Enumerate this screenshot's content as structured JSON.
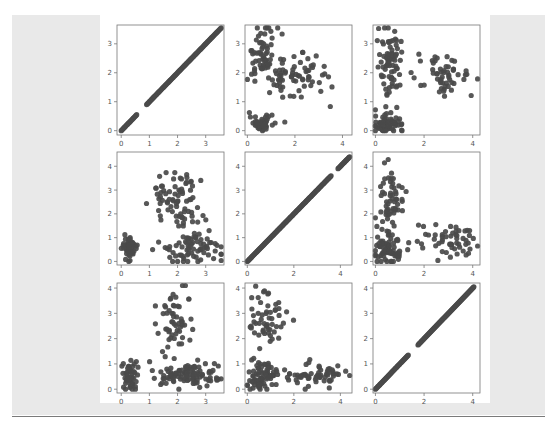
{
  "chart_data": {
    "type": "scatter",
    "title": "",
    "layout": "3x3 scatter matrix (pairplot)",
    "point_color": "#4a4a4a",
    "grid": false,
    "legend": null,
    "panels": [
      {
        "row": 0,
        "col": 0,
        "kind": "diagonal",
        "xlim": [
          -0.15,
          3.65
        ],
        "ylim": [
          -0.15,
          3.65
        ],
        "xticks": [
          0,
          1,
          2,
          3
        ],
        "yticks": [
          0,
          1,
          2,
          3
        ],
        "segments": [
          [
            0.0,
            0.55
          ],
          [
            0.9,
            3.55
          ]
        ]
      },
      {
        "row": 0,
        "col": 1,
        "kind": "clusters",
        "xlim": [
          -0.1,
          4.4
        ],
        "ylim": [
          -0.15,
          3.65
        ],
        "xticks": [
          0,
          2,
          4
        ],
        "yticks": [
          0,
          1,
          2,
          3
        ],
        "clusters": [
          {
            "cx": 0.6,
            "cy": 0.25,
            "sx": 0.25,
            "sy": 0.13,
            "n": 55
          },
          {
            "cx": 0.6,
            "cy": 2.6,
            "sx": 0.35,
            "sy": 0.55,
            "n": 60
          },
          {
            "cx": 2.1,
            "cy": 1.9,
            "sx": 0.8,
            "sy": 0.45,
            "n": 70
          }
        ]
      },
      {
        "row": 0,
        "col": 2,
        "kind": "clusters",
        "xlim": [
          -0.1,
          4.3
        ],
        "ylim": [
          -0.15,
          3.65
        ],
        "xticks": [
          0,
          2,
          4
        ],
        "yticks": [
          0,
          1,
          2,
          3
        ],
        "clusters": [
          {
            "cx": 0.55,
            "cy": 0.25,
            "sx": 0.3,
            "sy": 0.12,
            "n": 60
          },
          {
            "cx": 0.6,
            "cy": 2.3,
            "sx": 0.25,
            "sy": 0.65,
            "n": 80
          },
          {
            "cx": 2.9,
            "cy": 1.85,
            "sx": 0.6,
            "sy": 0.35,
            "n": 55
          }
        ]
      },
      {
        "row": 1,
        "col": 0,
        "kind": "clusters",
        "xlim": [
          -0.15,
          3.65
        ],
        "ylim": [
          -0.15,
          4.6
        ],
        "xticks": [
          0,
          1,
          2,
          3
        ],
        "yticks": [
          0,
          1,
          2,
          3,
          4
        ],
        "clusters": [
          {
            "cx": 0.3,
            "cy": 0.55,
            "sx": 0.13,
            "sy": 0.25,
            "n": 55
          },
          {
            "cx": 2.0,
            "cy": 2.4,
            "sx": 0.45,
            "sy": 0.85,
            "n": 80
          },
          {
            "cx": 2.6,
            "cy": 0.6,
            "sx": 0.6,
            "sy": 0.35,
            "n": 70
          }
        ]
      },
      {
        "row": 1,
        "col": 1,
        "kind": "diagonal",
        "xlim": [
          -0.1,
          4.5
        ],
        "ylim": [
          -0.15,
          4.6
        ],
        "xticks": [
          0,
          2,
          4
        ],
        "yticks": [
          0,
          1,
          2,
          3,
          4
        ],
        "segments": [
          [
            0.0,
            3.6
          ],
          [
            3.9,
            4.4
          ]
        ]
      },
      {
        "row": 1,
        "col": 2,
        "kind": "clusters",
        "xlim": [
          -0.1,
          4.3
        ],
        "ylim": [
          -0.15,
          4.6
        ],
        "xticks": [
          0,
          2,
          4
        ],
        "yticks": [
          0,
          1,
          2,
          3,
          4
        ],
        "clusters": [
          {
            "cx": 0.55,
            "cy": 0.5,
            "sx": 0.3,
            "sy": 0.3,
            "n": 70
          },
          {
            "cx": 0.6,
            "cy": 2.6,
            "sx": 0.25,
            "sy": 0.7,
            "n": 60
          },
          {
            "cx": 2.9,
            "cy": 0.85,
            "sx": 0.6,
            "sy": 0.4,
            "n": 55
          }
        ]
      },
      {
        "row": 2,
        "col": 0,
        "kind": "clusters",
        "xlim": [
          -0.15,
          3.65
        ],
        "ylim": [
          -0.15,
          4.2
        ],
        "xticks": [
          0,
          1,
          2,
          3
        ],
        "yticks": [
          0,
          1,
          2,
          3,
          4
        ],
        "clusters": [
          {
            "cx": 0.3,
            "cy": 0.55,
            "sx": 0.13,
            "sy": 0.3,
            "n": 55
          },
          {
            "cx": 2.0,
            "cy": 2.7,
            "sx": 0.35,
            "sy": 0.6,
            "n": 55
          },
          {
            "cx": 2.3,
            "cy": 0.55,
            "sx": 0.65,
            "sy": 0.22,
            "n": 100
          }
        ]
      },
      {
        "row": 2,
        "col": 1,
        "kind": "clusters",
        "xlim": [
          -0.1,
          4.5
        ],
        "ylim": [
          -0.15,
          4.2
        ],
        "xticks": [
          0,
          2,
          4
        ],
        "yticks": [
          0,
          1,
          2,
          3,
          4
        ],
        "clusters": [
          {
            "cx": 0.6,
            "cy": 0.5,
            "sx": 0.3,
            "sy": 0.3,
            "n": 80
          },
          {
            "cx": 0.9,
            "cy": 2.8,
            "sx": 0.4,
            "sy": 0.55,
            "n": 55
          },
          {
            "cx": 2.9,
            "cy": 0.55,
            "sx": 0.65,
            "sy": 0.22,
            "n": 60
          }
        ]
      },
      {
        "row": 2,
        "col": 2,
        "kind": "diagonal",
        "xlim": [
          -0.1,
          4.3
        ],
        "ylim": [
          -0.15,
          4.2
        ],
        "xticks": [
          0,
          2,
          4
        ],
        "yticks": [
          0,
          1,
          2,
          3,
          4
        ],
        "segments": [
          [
            0.0,
            1.35
          ],
          [
            1.75,
            4.05
          ]
        ]
      }
    ]
  },
  "footer": {
    "text": ""
  }
}
